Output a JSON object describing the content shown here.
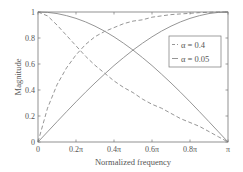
{
  "chart_data": {
    "type": "line",
    "title": "",
    "xlabel": "Normalized frequency",
    "ylabel": "Magnitude",
    "xlim": [
      0,
      1
    ],
    "ylim": [
      0,
      1
    ],
    "x_ticks": [
      "0",
      "0.2π",
      "0.4π",
      "0.6π",
      "0.8π",
      "π"
    ],
    "x_tick_values": [
      0,
      0.2,
      0.4,
      0.6,
      0.8,
      1.0
    ],
    "y_ticks": [
      "0",
      "0.2",
      "0.4",
      "0.6",
      "0.8",
      "1"
    ],
    "y_tick_values": [
      0,
      0.2,
      0.4,
      0.6,
      0.8,
      1.0
    ],
    "grid": false,
    "legend_position": "upper right (inside)",
    "x": [
      0,
      0.05,
      0.1,
      0.15,
      0.2,
      0.25,
      0.3,
      0.35,
      0.4,
      0.45,
      0.5,
      0.55,
      0.6,
      0.65,
      0.7,
      0.75,
      0.8,
      0.85,
      0.9,
      0.95,
      1.0
    ],
    "series": [
      {
        "name": "α = 0.4 (lowpass)",
        "legend_label": "α = 0.4",
        "style": "dashed",
        "color": "#8a8a8a",
        "values": [
          1.0,
          0.97,
          0.9,
          0.82,
          0.74,
          0.66,
          0.59,
          0.53,
          0.47,
          0.42,
          0.38,
          0.33,
          0.29,
          0.26,
          0.22,
          0.18,
          0.15,
          0.12,
          0.08,
          0.04,
          0.0
        ]
      },
      {
        "name": "α = 0.4 (highpass)",
        "legend_label": "",
        "style": "dashed",
        "color": "#8a8a8a",
        "values": [
          0.0,
          0.26,
          0.44,
          0.57,
          0.67,
          0.75,
          0.81,
          0.85,
          0.88,
          0.91,
          0.93,
          0.94,
          0.96,
          0.97,
          0.98,
          0.985,
          0.99,
          0.995,
          0.998,
          1.0,
          1.0
        ]
      },
      {
        "name": "α = 0.05 (lowpass)",
        "legend_label": "α = 0.05",
        "style": "solid",
        "color": "#8a8a8a",
        "values": [
          1.0,
          0.997,
          0.988,
          0.972,
          0.951,
          0.924,
          0.891,
          0.853,
          0.809,
          0.76,
          0.707,
          0.649,
          0.588,
          0.522,
          0.454,
          0.383,
          0.309,
          0.233,
          0.156,
          0.078,
          0.0
        ]
      },
      {
        "name": "α = 0.05 (highpass)",
        "legend_label": "",
        "style": "solid",
        "color": "#8a8a8a",
        "values": [
          0.0,
          0.078,
          0.156,
          0.233,
          0.309,
          0.383,
          0.454,
          0.522,
          0.588,
          0.649,
          0.707,
          0.76,
          0.809,
          0.853,
          0.891,
          0.924,
          0.951,
          0.972,
          0.988,
          0.997,
          1.0
        ]
      }
    ]
  },
  "legend": {
    "items": [
      {
        "label": "α = 0.4",
        "style": "dashed"
      },
      {
        "label": "α = 0.05",
        "style": "solid"
      }
    ]
  },
  "colors": {
    "axis": "#777777",
    "line": "#8a8a8a"
  }
}
